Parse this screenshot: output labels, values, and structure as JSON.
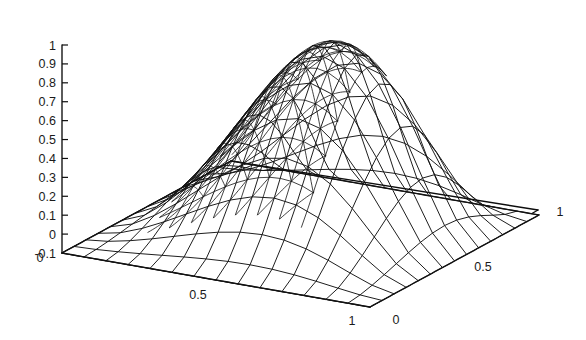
{
  "figure": {
    "name": "3d-surface-mesh-plot",
    "type": "surface-mesh",
    "background_color": "#ffffff",
    "line_color": "#121212"
  },
  "chart_data": {
    "type": "surface",
    "title": "",
    "subtitle": "",
    "xlabel": "",
    "ylabel": "",
    "zlabel": "",
    "projection": "axonometric",
    "grid": false,
    "legend": null,
    "x_axis": {
      "label": "",
      "range": [
        0,
        1
      ],
      "ticks": [
        0,
        0.5,
        1
      ],
      "tick_labels": [
        "0",
        "0.5",
        "1"
      ]
    },
    "y_axis": {
      "label": "",
      "range": [
        0,
        1
      ],
      "ticks": [
        0,
        0.5,
        1
      ],
      "tick_labels": [
        "0",
        "0.5",
        "1"
      ]
    },
    "z_axis": {
      "label": "",
      "range": [
        -0.1,
        1
      ],
      "ticks": [
        -0.1,
        0,
        0.1,
        0.2,
        0.3,
        0.4,
        0.5,
        0.6,
        0.7,
        0.8,
        0.9,
        1
      ],
      "tick_labels": [
        "-0.1",
        "0",
        "0.1",
        "0.2",
        "0.3",
        "0.4",
        "0.5",
        "0.6",
        "0.7",
        "0.8",
        "0.9",
        "1"
      ]
    },
    "surface": {
      "peak_value": 1.0,
      "min_value": 0.0,
      "peak_location": [
        0.42,
        0.42
      ],
      "boundary_value": 0.0,
      "nx": 21,
      "ny": 21,
      "formula": "sin(pi*x)*sin(pi*y) bump",
      "refined_region": {
        "x": [
          0.18,
          0.68
        ],
        "y": [
          0.18,
          0.68
        ],
        "note": "mesh subdivided with diagonals where the solution curvature is largest"
      }
    }
  },
  "z_ticks": [
    {
      "value": 1,
      "label": "1"
    },
    {
      "value": 0.9,
      "label": "0.9"
    },
    {
      "value": 0.8,
      "label": "0.8"
    },
    {
      "value": 0.7,
      "label": "0.7"
    },
    {
      "value": 0.6,
      "label": "0.6"
    },
    {
      "value": 0.5,
      "label": "0.5"
    },
    {
      "value": 0.4,
      "label": "0.4"
    },
    {
      "value": 0.3,
      "label": "0.3"
    },
    {
      "value": 0.2,
      "label": "0.2"
    },
    {
      "value": 0.1,
      "label": "0.1"
    },
    {
      "value": 0,
      "label": "0"
    },
    {
      "value": -0.1,
      "label": "-0.1"
    }
  ],
  "base_labels": {
    "origin": "0",
    "x_mid": "0.5",
    "x_end": "1",
    "y_start": "0",
    "y_mid": "0.5",
    "y_end": "1"
  }
}
